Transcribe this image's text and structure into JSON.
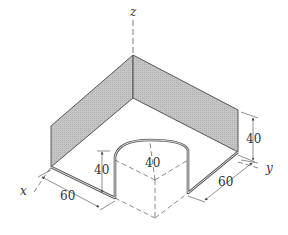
{
  "figure": {
    "axes": {
      "x": "x",
      "y": "y",
      "z": "z"
    },
    "dimensions": {
      "x_length": "60",
      "y_length": "60",
      "arch_height": "40",
      "arch_radius": "40",
      "wall_height": "40"
    },
    "colors": {
      "panel_fill": "#bdbdbd",
      "panel_fill_right": "#c8c8c8",
      "rod_stroke": "#555555",
      "dim_line": "#444444"
    }
  }
}
